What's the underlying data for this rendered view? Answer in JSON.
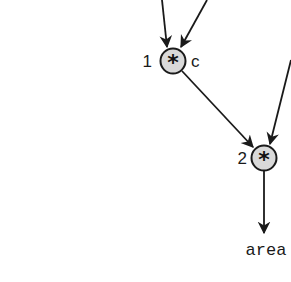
{
  "diagram": {
    "type": "computation-graph",
    "nodes": [
      {
        "id": "node-1",
        "index_label": "1",
        "operator": "*",
        "side_label": "c",
        "fill": "#d9d9d9"
      },
      {
        "id": "node-2",
        "index_label": "2",
        "operator": "*",
        "side_label": "",
        "fill": "#d9d9d9"
      }
    ],
    "output": {
      "label": "area"
    },
    "edges": [
      {
        "from": "offscreen-top-left",
        "to": "node-1"
      },
      {
        "from": "offscreen-top-right",
        "to": "node-1"
      },
      {
        "from": "node-1",
        "to": "node-2"
      },
      {
        "from": "offscreen-right",
        "to": "node-2"
      },
      {
        "from": "node-2",
        "to": "area"
      }
    ],
    "colors": {
      "stroke": "#1a1a1a",
      "node_fill": "#d9d9d9",
      "background": "#ffffff"
    }
  }
}
